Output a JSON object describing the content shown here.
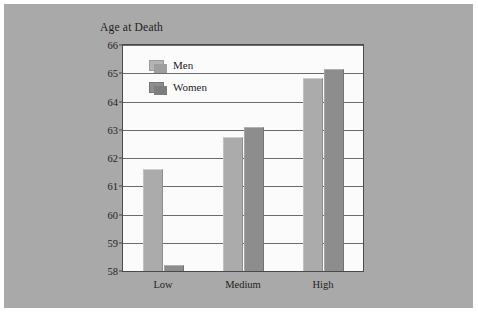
{
  "chart_data": {
    "type": "bar",
    "title": "Age at Death",
    "xlabel": "",
    "ylabel": "",
    "categories": [
      "Low",
      "Medium",
      "High"
    ],
    "series": [
      {
        "name": "Men",
        "values": [
          61.6,
          62.75,
          64.85
        ],
        "color": "#ababab"
      },
      {
        "name": "Women",
        "values": [
          58.2,
          63.1,
          65.15
        ],
        "color": "#8d8d8d"
      }
    ],
    "ylim": [
      58,
      66
    ],
    "yticks": [
      58,
      59,
      60,
      61,
      62,
      63,
      64,
      65,
      66
    ],
    "ytick_labels": [
      "58",
      "59",
      "60",
      "61",
      "62",
      "63",
      "64",
      "65",
      "66"
    ],
    "grid": true,
    "legend_position": "inside-top-left"
  },
  "legend": {
    "items": [
      {
        "label": "Men",
        "swatch": "men-swatch"
      },
      {
        "label": "Women",
        "swatch": "women-swatch"
      }
    ]
  },
  "colors": {
    "figure_background": "#a9a9a9",
    "plot_background": "#fbfbfb",
    "frame": "#4a4a4a",
    "gridline": "#6b6b6b",
    "men_bar": "#ababab",
    "women_bar": "#8d8d8d",
    "text": "#1d1d1d"
  }
}
